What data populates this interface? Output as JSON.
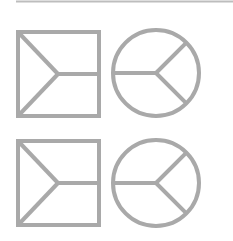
{
  "figure": {
    "stroke_color": "#a9a9a9",
    "rule_color": "#bdbdbd",
    "stroke_width": 4,
    "rows": [
      {
        "square": {
          "x": 18,
          "y": 32,
          "w": 81,
          "h": 84,
          "junction": [
            58,
            74
          ]
        },
        "circle": {
          "cx": 156,
          "cy": 73,
          "r": 43
        }
      },
      {
        "square": {
          "x": 18,
          "y": 141,
          "w": 81,
          "h": 84,
          "junction": [
            58,
            183
          ]
        },
        "circle": {
          "cx": 156,
          "cy": 183,
          "r": 43
        }
      }
    ]
  }
}
